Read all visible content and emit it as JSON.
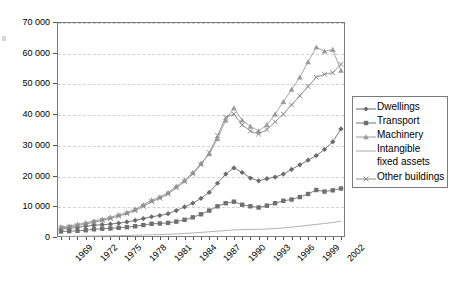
{
  "chart_data": {
    "type": "line",
    "title": "",
    "xlabel": "",
    "ylabel": "",
    "ylim": [
      0,
      70000
    ],
    "ytick_step": 10000,
    "grid": true,
    "legend_position": "right",
    "yticks": [
      "0",
      "10 000",
      "20 000",
      "30 000",
      "40 000",
      "50 000",
      "60 000",
      "70 000"
    ],
    "ytick_values": [
      0,
      10000,
      20000,
      30000,
      40000,
      50000,
      60000,
      70000
    ],
    "x": [
      1969,
      1970,
      1971,
      1972,
      1973,
      1974,
      1975,
      1976,
      1977,
      1978,
      1979,
      1980,
      1981,
      1982,
      1983,
      1984,
      1985,
      1986,
      1987,
      1988,
      1989,
      1990,
      1991,
      1992,
      1993,
      1994,
      1995,
      1996,
      1997,
      1998,
      1999,
      2000,
      2001,
      2002,
      2003
    ],
    "xtick_labels": [
      "1969",
      "1972",
      "1975",
      "1978",
      "1981",
      "1984",
      "1987",
      "1990",
      "1993",
      "1996",
      "1999",
      "2002"
    ],
    "xtick_values": [
      1969,
      1972,
      1975,
      1978,
      1981,
      1984,
      1987,
      1990,
      1993,
      1996,
      1999,
      2002
    ],
    "series": [
      {
        "name": "Dwellings",
        "marker": "diamond",
        "color": "#6b6b6b",
        "values": [
          2600,
          2800,
          3100,
          3500,
          3800,
          4000,
          4200,
          4500,
          4900,
          5400,
          6000,
          6600,
          7000,
          7600,
          8600,
          9800,
          11000,
          12600,
          14500,
          17500,
          20500,
          22500,
          21000,
          19200,
          18300,
          19000,
          19500,
          20500,
          22000,
          23500,
          25000,
          26500,
          28500,
          31000,
          35200
        ]
      },
      {
        "name": "Transport",
        "marker": "square",
        "color": "#707070",
        "values": [
          1800,
          1900,
          2000,
          2200,
          2500,
          2700,
          2800,
          3000,
          3200,
          3500,
          3900,
          4300,
          4400,
          4600,
          5000,
          5600,
          6400,
          7400,
          8600,
          10000,
          11000,
          11500,
          10500,
          10000,
          9600,
          10200,
          11000,
          11800,
          12200,
          13000,
          14000,
          15300,
          14800,
          15200,
          15800
        ]
      },
      {
        "name": "Machinery",
        "marker": "triangle",
        "color": "#9a9a9a",
        "values": [
          3300,
          3600,
          4100,
          4600,
          5200,
          5800,
          6400,
          7200,
          8000,
          9000,
          10500,
          12000,
          13000,
          14500,
          16500,
          18500,
          21000,
          24000,
          27000,
          32000,
          38000,
          42000,
          38000,
          36000,
          34500,
          36500,
          40000,
          44000,
          48000,
          52000,
          57000,
          61800,
          60500,
          61000,
          54200
        ]
      },
      {
        "name": "Intangible fixed assets",
        "marker": "none",
        "color": "#a8a8a8",
        "values": [
          200,
          220,
          250,
          280,
          320,
          360,
          400,
          450,
          500,
          560,
          640,
          720,
          800,
          900,
          1000,
          1150,
          1300,
          1500,
          1700,
          1900,
          2100,
          2300,
          2400,
          2450,
          2500,
          2600,
          2750,
          2950,
          3200,
          3500,
          3800,
          4100,
          4400,
          4700,
          5200
        ]
      },
      {
        "name": "Other buildings",
        "marker": "cross",
        "color": "#8a8a8a",
        "values": [
          3000,
          3300,
          3700,
          4200,
          4800,
          5400,
          6000,
          6800,
          7600,
          8600,
          10000,
          11500,
          12600,
          14000,
          16000,
          18000,
          20500,
          23500,
          27500,
          33000,
          39000,
          40000,
          36500,
          34500,
          33500,
          35000,
          37500,
          40000,
          43000,
          46000,
          49000,
          52000,
          53000,
          53500,
          56200
        ]
      }
    ]
  },
  "legend": {
    "items": [
      {
        "label": "Dwellings",
        "marker": "diamond"
      },
      {
        "label": "Transport",
        "marker": "square"
      },
      {
        "label": "Machinery",
        "marker": "triangle"
      },
      {
        "label": "Intangible",
        "marker": "line",
        "continuation": "fixed assets"
      },
      {
        "label": "Other buildings",
        "marker": "cross"
      }
    ]
  }
}
